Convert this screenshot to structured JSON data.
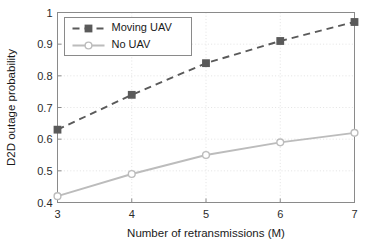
{
  "chart_data": {
    "type": "line",
    "title": "",
    "xlabel": "Number of retransmissions (M)",
    "ylabel": "D2D outage probability",
    "x": [
      3,
      4,
      5,
      6,
      7
    ],
    "xticklabels": [
      "3",
      "4",
      "5",
      "6",
      "7"
    ],
    "yticklabels": [
      "0.4",
      "0.5",
      "0.6",
      "0.7",
      "0.8",
      "0.9",
      "1"
    ],
    "yticks": [
      0.4,
      0.5,
      0.6,
      0.7,
      0.8,
      0.9,
      1.0
    ],
    "xlim": [
      3,
      7
    ],
    "ylim": [
      0.4,
      1.0
    ],
    "grid": true,
    "legend_position": "upper-left",
    "series": [
      {
        "name": "Moving UAV",
        "values": [
          0.63,
          0.74,
          0.84,
          0.91,
          0.97
        ],
        "color": "#5a5a5a",
        "linestyle": "dashed",
        "marker": "square"
      },
      {
        "name": "No UAV",
        "values": [
          0.42,
          0.49,
          0.55,
          0.59,
          0.62
        ],
        "color": "#bcbcbc",
        "linestyle": "solid",
        "marker": "circle"
      }
    ]
  },
  "legend": {
    "entries": [
      {
        "label": "Moving UAV"
      },
      {
        "label": "No UAV"
      }
    ]
  },
  "axes": {
    "x_title": "Number of retransmissions (M)",
    "y_title": "D2D outage probability"
  }
}
